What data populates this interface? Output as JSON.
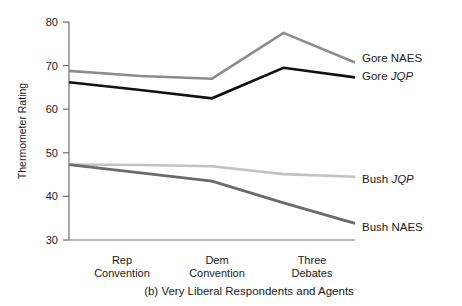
{
  "chart_data": {
    "type": "line",
    "title": "",
    "caption": "(b) Very Liberal Respondents and Agents",
    "xlabel": "",
    "ylabel": "Thermometer Rating",
    "ylim": [
      30,
      80
    ],
    "yticks": [
      30,
      40,
      50,
      60,
      70,
      80
    ],
    "ytick_labels": [
      "30",
      "40",
      "50",
      "60",
      "70",
      "80"
    ],
    "grid": false,
    "legend_position": "right-inline",
    "x": [
      0,
      1,
      2,
      3,
      4
    ],
    "categories": [
      "",
      "Rep Convention",
      "Dem Convention",
      "Three Debates",
      ""
    ],
    "xtick_labels": [
      {
        "line1": "Rep",
        "line2": "Convention"
      },
      {
        "line1": "Dem",
        "line2": "Convention"
      },
      {
        "line1": "Three",
        "line2": "Debates"
      }
    ],
    "series": [
      {
        "name": "Gore NAES",
        "label_plain": "Gore NAES",
        "label_italic_part": "",
        "color": "#8c8c8c",
        "width": 2.6,
        "values": [
          68.8,
          67.6,
          67.0,
          77.5,
          70.7
        ]
      },
      {
        "name": "Gore JQP",
        "label_plain": "Gore ",
        "label_italic_part": "JQP",
        "color": "#111111",
        "width": 2.6,
        "values": [
          66.2,
          64.4,
          62.5,
          69.5,
          67.3
        ]
      },
      {
        "name": "Bush JQP",
        "label_plain": "Bush ",
        "label_italic_part": "JQP",
        "color": "#c2c2c2",
        "width": 2.6,
        "values": [
          47.3,
          47.2,
          46.9,
          45.1,
          44.5
        ]
      },
      {
        "name": "Bush NAES",
        "label_plain": "Bush ",
        "label_italic_part": "NAES",
        "color": "#6b6b6b",
        "width": 2.9,
        "values": [
          47.3,
          45.4,
          43.5,
          38.5,
          33.8
        ]
      }
    ],
    "legend_entries": [
      {
        "text": "Gore NAES",
        "plain": "Gore NAES",
        "italic": ""
      },
      {
        "text": "Gore JQP",
        "plain": "Gore ",
        "italic": "JQP"
      },
      {
        "text": "Bush JQP",
        "plain": "Bush ",
        "italic": "JQP"
      },
      {
        "text": "Bush NAES",
        "plain": "Bush NAES",
        "italic": ""
      }
    ]
  },
  "axis": {
    "y_title": "Thermometer Rating",
    "y_tick_0": "80",
    "y_tick_1": "70",
    "y_tick_2": "60",
    "y_tick_3": "50",
    "y_tick_4": "40",
    "y_tick_5": "30"
  },
  "xlabels": {
    "rep_line1": "Rep",
    "rep_line2": "Convention",
    "dem_line1": "Dem",
    "dem_line2": "Convention",
    "deb_line1": "Three",
    "deb_line2": "Debates"
  },
  "legend": {
    "gore_naes": "Gore NAES",
    "gore_jqp_plain": "Gore ",
    "gore_jqp_italic": "JQP",
    "bush_jqp_plain": "Bush ",
    "bush_jqp_italic": "JQP",
    "bush_naes": "Bush NAES"
  },
  "caption": {
    "text": "(b) Very Liberal Respondents and Agents"
  }
}
